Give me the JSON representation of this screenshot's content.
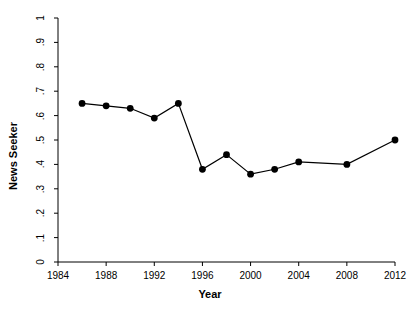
{
  "chart_data": {
    "type": "line",
    "title": "",
    "subtitle": "",
    "xlabel": "Year",
    "ylabel": "News Seeker",
    "xlim": [
      1984,
      2012
    ],
    "ylim": [
      0,
      1
    ],
    "grid": false,
    "legend": null,
    "x": [
      1986,
      1988,
      1990,
      1992,
      1994,
      1996,
      1998,
      2000,
      2002,
      2004,
      2008,
      2012
    ],
    "values": [
      0.65,
      0.64,
      0.63,
      0.59,
      0.65,
      0.38,
      0.44,
      0.36,
      0.38,
      0.41,
      0.4,
      0.5
    ],
    "series": [
      {
        "name": "News Seeker",
        "x": [
          1986,
          1988,
          1990,
          1992,
          1994,
          1996,
          1998,
          2000,
          2002,
          2004,
          2008,
          2012
        ],
        "values": [
          0.65,
          0.64,
          0.63,
          0.59,
          0.65,
          0.38,
          0.44,
          0.36,
          0.38,
          0.41,
          0.4,
          0.5
        ],
        "marker": "filled-circle",
        "color": "#000000",
        "line_color": "#000000"
      }
    ],
    "xticks": [
      1984,
      1988,
      1992,
      1996,
      2000,
      2004,
      2008,
      2012
    ],
    "xtick_labels": [
      "1984",
      "1988",
      "1992",
      "1996",
      "2000",
      "2004",
      "2008",
      "2012"
    ],
    "yticks": [
      0,
      0.1,
      0.2,
      0.3,
      0.4,
      0.5,
      0.6,
      0.7,
      0.8,
      0.9,
      1
    ],
    "ytick_labels": [
      "0",
      ".1",
      ".2",
      ".3",
      ".4",
      ".5",
      ".6",
      ".7",
      ".8",
      ".9",
      "1"
    ],
    "axis_color": "#000000",
    "background": "#ffffff"
  }
}
